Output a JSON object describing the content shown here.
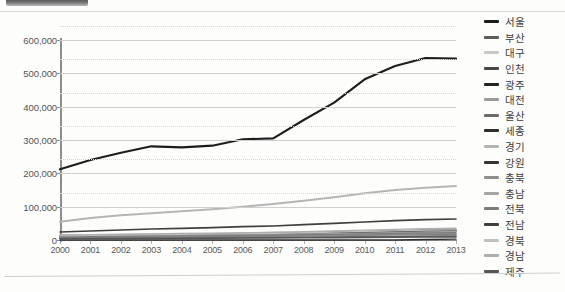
{
  "chart_data": {
    "type": "line",
    "title": "",
    "xlabel": "",
    "ylabel": "",
    "x": [
      2000,
      2001,
      2002,
      2003,
      2004,
      2005,
      2006,
      2007,
      2008,
      2009,
      2010,
      2011,
      2012,
      2013
    ],
    "xtick_labels": [
      "2000",
      "2001",
      "2002",
      "2003",
      "2004",
      "2005",
      "2006",
      "2007",
      "2008",
      "2009",
      "2010",
      "2011",
      "2012",
      "2013"
    ],
    "ylim": [
      0,
      600000
    ],
    "ytick_labels": [
      "0",
      "100,000",
      "200,000",
      "300,000",
      "400,000",
      "500,000",
      "600,000"
    ],
    "ytick_values": [
      0,
      100000,
      200000,
      300000,
      400000,
      500000,
      600000
    ],
    "grid": true,
    "legend_position": "right",
    "series": [
      {
        "name": "서울",
        "color": "#1d1d1d",
        "width": 2.1,
        "values": [
          212000,
          240000,
          262000,
          281000,
          278000,
          283000,
          302000,
          305000,
          360000,
          412000,
          482000,
          522000,
          546000,
          544000
        ]
      },
      {
        "name": "부산",
        "color": "#5d5d5d",
        "width": 1.3,
        "values": [
          14000,
          15000,
          16000,
          17000,
          17500,
          18000,
          19000,
          20000,
          22000,
          24000,
          26000,
          28000,
          30000,
          31000
        ]
      },
      {
        "name": "대구",
        "color": "#c8c8c8",
        "width": 1.3,
        "values": [
          9000,
          9500,
          10000,
          10500,
          11000,
          11500,
          12000,
          12500,
          13500,
          14500,
          15500,
          16500,
          17500,
          18000
        ]
      },
      {
        "name": "인천",
        "color": "#474747",
        "width": 1.3,
        "values": [
          11000,
          12000,
          13000,
          14000,
          14500,
          15000,
          16000,
          17000,
          18500,
          20000,
          22000,
          24000,
          26000,
          27000
        ]
      },
      {
        "name": "광주",
        "color": "#232323",
        "width": 1.3,
        "values": [
          7000,
          7500,
          8000,
          8500,
          8800,
          9200,
          9800,
          10200,
          11000,
          12000,
          13000,
          14000,
          15000,
          15500
        ]
      },
      {
        "name": "대전",
        "color": "#9a9a9a",
        "width": 1.3,
        "values": [
          6500,
          7000,
          7400,
          7800,
          8100,
          8500,
          9000,
          9400,
          10200,
          11000,
          12000,
          13000,
          14000,
          14500
        ]
      },
      {
        "name": "울산",
        "color": "#6b6b6b",
        "width": 1.3,
        "values": [
          5000,
          5400,
          5800,
          6200,
          6500,
          6800,
          7200,
          7600,
          8200,
          8900,
          9600,
          10300,
          11000,
          11400
        ]
      },
      {
        "name": "세종",
        "color": "#2e2e2e",
        "width": 1.3,
        "values": [
          0,
          0,
          0,
          0,
          0,
          0,
          0,
          0,
          0,
          0,
          0,
          0,
          1500,
          2500
        ]
      },
      {
        "name": "경기",
        "color": "#b5b5b5",
        "width": 2.0,
        "values": [
          55000,
          66000,
          74000,
          80000,
          86000,
          92000,
          100000,
          108000,
          118000,
          128000,
          140000,
          150000,
          157000,
          162000
        ]
      },
      {
        "name": "강원",
        "color": "#353535",
        "width": 1.3,
        "values": [
          12000,
          13000,
          14000,
          15000,
          15500,
          16000,
          17000,
          18000,
          19500,
          21000,
          23000,
          25000,
          27000,
          28000
        ]
      },
      {
        "name": "충북",
        "color": "#8e8e8e",
        "width": 1.3,
        "values": [
          8000,
          8600,
          9200,
          9800,
          10200,
          10800,
          11500,
          12200,
          13200,
          14200,
          15500,
          16800,
          18000,
          18800
        ]
      },
      {
        "name": "충남",
        "color": "#a5a5a5",
        "width": 1.3,
        "values": [
          10000,
          10800,
          11600,
          12400,
          13000,
          13800,
          14800,
          15800,
          17200,
          18800,
          20500,
          22200,
          24000,
          25000
        ]
      },
      {
        "name": "전북",
        "color": "#7b7b7b",
        "width": 1.3,
        "values": [
          9500,
          10200,
          10900,
          11600,
          12100,
          12700,
          13500,
          14300,
          15500,
          16800,
          18200,
          19600,
          21000,
          22000
        ]
      },
      {
        "name": "전남",
        "color": "#3f3f3f",
        "width": 1.6,
        "values": [
          24000,
          27000,
          30000,
          33000,
          35000,
          37000,
          40000,
          42000,
          46000,
          50000,
          54000,
          58000,
          61000,
          63000
        ]
      },
      {
        "name": "경북",
        "color": "#c0c0c0",
        "width": 1.3,
        "values": [
          13000,
          14000,
          15000,
          16000,
          16800,
          17600,
          18800,
          20000,
          21800,
          23600,
          25600,
          27600,
          29500,
          30500
        ]
      },
      {
        "name": "경남",
        "color": "#aeaeae",
        "width": 1.3,
        "values": [
          15000,
          16200,
          17400,
          18600,
          19500,
          20400,
          21800,
          23200,
          25200,
          27200,
          29500,
          31800,
          34000,
          35200
        ]
      },
      {
        "name": "제주",
        "color": "#565656",
        "width": 1.6,
        "values": [
          4000,
          4300,
          4600,
          4900,
          5100,
          5400,
          5800,
          6100,
          6600,
          7200,
          7800,
          8400,
          9000,
          9400
        ]
      }
    ]
  }
}
